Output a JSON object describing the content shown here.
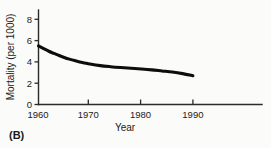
{
  "figure": {
    "panel_label": "(B)",
    "background_color": "#fbfbfa",
    "curve_color": "#0d0d0d",
    "axis_color": "#2b2b2b"
  },
  "chart_data": {
    "type": "line",
    "title": "",
    "subtitle": "",
    "xlabel": "Year",
    "ylabel": "Mortality (per 1000)",
    "xlim": [
      1960,
      1990
    ],
    "ylim": [
      0,
      9
    ],
    "xticks": [
      1960,
      1970,
      1980,
      1990
    ],
    "xtick_labels": [
      "1960",
      "1970",
      "1980",
      "1990"
    ],
    "yticks": [
      0,
      2,
      4,
      6,
      8
    ],
    "ytick_labels": [
      "0",
      "2",
      "4",
      "6",
      "8"
    ],
    "grid": false,
    "legend": null,
    "annotations": [
      "(B)"
    ],
    "series": [
      {
        "name": "Mortality (per 1000)",
        "x": [
          1960,
          1961,
          1962,
          1963,
          1964,
          1965,
          1966,
          1967,
          1968,
          1969,
          1970,
          1972,
          1974,
          1976,
          1978,
          1980,
          1982,
          1984,
          1986,
          1988,
          1990
        ],
        "values": [
          5.5,
          5.25,
          5.0,
          4.8,
          4.6,
          4.42,
          4.26,
          4.12,
          4.0,
          3.9,
          3.8,
          3.65,
          3.55,
          3.47,
          3.4,
          3.33,
          3.25,
          3.15,
          3.05,
          2.9,
          2.7
        ]
      }
    ]
  }
}
